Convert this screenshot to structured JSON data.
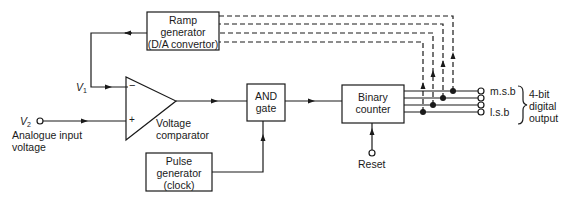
{
  "diagram": {
    "blocks": {
      "ramp_generator": {
        "line1": "Ramp",
        "line2": "generator",
        "line3": "(D/A convertor)"
      },
      "voltage_comparator": {
        "line1": "Voltage",
        "line2": "comparator",
        "minus": "−",
        "plus": "+"
      },
      "and_gate": {
        "line1": "AND",
        "line2": "gate"
      },
      "binary_counter": {
        "line1": "Binary",
        "line2": "counter"
      },
      "pulse_generator": {
        "line1": "Pulse",
        "line2": "generator",
        "line3": "(clock)"
      }
    },
    "signals": {
      "v1": {
        "symbol": "V",
        "sub": "1"
      },
      "v2": {
        "symbol": "V",
        "sub": "2"
      },
      "input_label_line1": "Analogue input",
      "input_label_line2": "voltage",
      "reset": "Reset",
      "msb": "m.s.b",
      "lsb": "l.s.b",
      "output_line1": "4-bit",
      "output_line2": "digital",
      "output_line3": "output"
    },
    "colors": {
      "line": "#1a1a1a",
      "background": "#ffffff"
    }
  }
}
